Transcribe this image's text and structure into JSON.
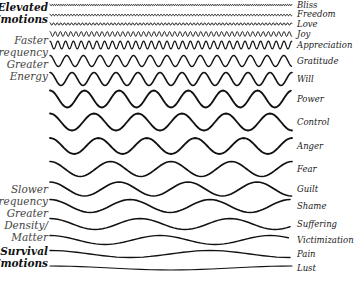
{
  "left_groups": [
    {
      "lines": [
        "Elevated",
        "Emotions"
      ],
      "style": "bold",
      "top": 2,
      "right": 300
    },
    {
      "lines": [
        "Faster",
        "Frequency",
        "Greater",
        "Energy"
      ],
      "style": "light",
      "top": 35,
      "right": 300
    },
    {
      "lines": [
        "Slower",
        "Frequency",
        "Greater",
        "Density/",
        "Matter"
      ],
      "style": "light",
      "top": 184,
      "right": 300
    },
    {
      "lines": [
        "Survival",
        "Emotions"
      ],
      "style": "bold",
      "top": 246,
      "right": 300
    }
  ],
  "waves": [
    {
      "label": "Bliss",
      "y": 5,
      "label_y": 1,
      "period": 2.2,
      "amp": 0.6,
      "stroke": 1.0
    },
    {
      "label": "Freedom",
      "y": 15,
      "label_y": 10,
      "period": 3.0,
      "amp": 0.8,
      "stroke": 1.0
    },
    {
      "label": "Love",
      "y": 24,
      "label_y": 20,
      "period": 3.6,
      "amp": 1.2,
      "stroke": 1.0
    },
    {
      "label": "Joy",
      "y": 34,
      "label_y": 30,
      "period": 5.2,
      "amp": 2.4,
      "stroke": 1.0
    },
    {
      "label": "Appreciation",
      "y": 45,
      "label_y": 41,
      "period": 7.8,
      "amp": 3.8,
      "stroke": 1.2
    },
    {
      "label": "Gratitude",
      "y": 61,
      "label_y": 57,
      "period": 16.7,
      "amp": 5.5,
      "stroke": 1.4
    },
    {
      "label": "Will",
      "y": 79,
      "label_y": 75,
      "period": 22.0,
      "amp": 6.5,
      "stroke": 1.6
    },
    {
      "label": "Power",
      "y": 99,
      "label_y": 95,
      "period": 34.6,
      "amp": 8.5,
      "stroke": 1.9
    },
    {
      "label": "Control",
      "y": 122,
      "label_y": 118,
      "period": 44.0,
      "amp": 8.5,
      "stroke": 1.8
    },
    {
      "label": "Anger",
      "y": 146,
      "label_y": 142,
      "period": 48.4,
      "amp": 8.0,
      "stroke": 1.8
    },
    {
      "label": "Fear",
      "y": 169,
      "label_y": 165,
      "period": 60.5,
      "amp": 7.5,
      "stroke": 1.7
    },
    {
      "label": "Guilt",
      "y": 189,
      "label_y": 185,
      "period": 69.0,
      "amp": 7.0,
      "stroke": 1.7
    },
    {
      "label": "Shame",
      "y": 206,
      "label_y": 202,
      "period": 80.0,
      "amp": 6.5,
      "stroke": 1.6
    },
    {
      "label": "Suffering",
      "y": 224,
      "label_y": 220,
      "period": 90.0,
      "amp": 5.5,
      "stroke": 1.5
    },
    {
      "label": "Victimization",
      "y": 240,
      "label_y": 236,
      "period": 110.0,
      "amp": 4.5,
      "stroke": 1.4
    },
    {
      "label": "Pain",
      "y": 254,
      "label_y": 250,
      "period": 160.0,
      "amp": 3.5,
      "stroke": 1.3
    },
    {
      "label": "Lust",
      "y": 268,
      "label_y": 264,
      "period": 242.0,
      "amp": 2.0,
      "stroke": 1.2
    }
  ],
  "wave_x_start": 50,
  "wave_x_end": 292
}
